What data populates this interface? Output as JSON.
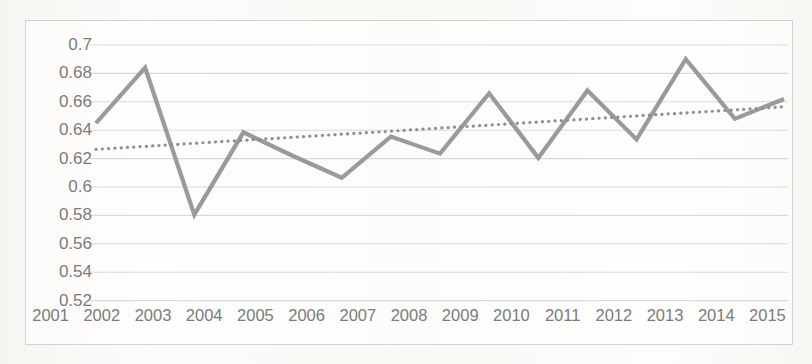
{
  "chart_data": {
    "type": "line",
    "title": "",
    "subtitle": "",
    "xlabel": "",
    "ylabel": "",
    "grid": true,
    "legend": "none",
    "xlim": [
      2001,
      2015
    ],
    "ylim": [
      0.52,
      0.7
    ],
    "ytick_step": 0.02,
    "categories": [
      "2001",
      "2002",
      "2003",
      "2004",
      "2005",
      "2006",
      "2007",
      "2008",
      "2009",
      "2010",
      "2011",
      "2012",
      "2013",
      "2014",
      "2015"
    ],
    "x_tick_labels": [
      "2001",
      "2002",
      "2003",
      "2004",
      "2005",
      "2006",
      "2007",
      "2008",
      "2009",
      "2010",
      "2011",
      "2012",
      "2013",
      "2014",
      "2015"
    ],
    "y_tick_labels": [
      "0.7",
      "0.68",
      "0.66",
      "0.64",
      "0.62",
      "0.6",
      "0.58",
      "0.56",
      "0.54",
      "0.52"
    ],
    "y_tick_values": [
      0.7,
      0.68,
      0.66,
      0.64,
      0.62,
      0.6,
      0.58,
      0.56,
      0.54,
      0.52
    ],
    "series": [
      {
        "name": "series-1",
        "style": "solid",
        "color": "#9a9a9a",
        "width": 4.2,
        "values": [
          0.645,
          0.684,
          0.5805,
          0.6385,
          0.622,
          0.6065,
          0.6355,
          0.6235,
          0.666,
          0.6205,
          0.668,
          0.6335,
          0.69,
          0.648,
          0.662
        ]
      },
      {
        "name": "trendline",
        "style": "dotted",
        "color": "#8f8f8f",
        "width": 3.2,
        "values": [
          0.6265,
          0.6286,
          0.6308,
          0.6329,
          0.635,
          0.6372,
          0.6393,
          0.6415,
          0.6436,
          0.6458,
          0.6479,
          0.6501,
          0.6522,
          0.6543,
          0.6565
        ]
      }
    ],
    "colors": {
      "series_line": "#9a9a9a",
      "trendline": "#8f8f8f",
      "gridline": "#d9d9d9",
      "frame_border": "#d3d3d3",
      "tick_label": "#7b7b7b",
      "plot_background": "#fdfdfb"
    }
  }
}
